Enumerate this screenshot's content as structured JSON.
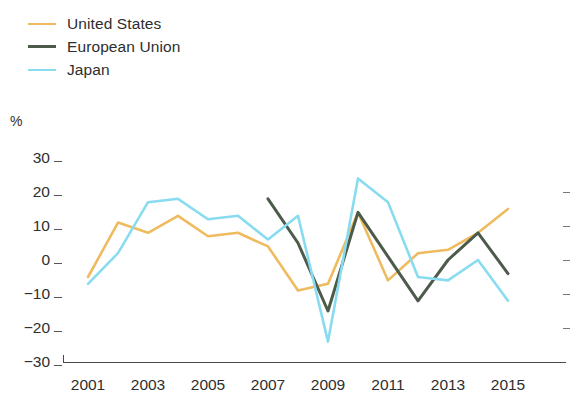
{
  "legend": {
    "position": "top-left",
    "items": [
      {
        "label": "United States",
        "color": "#efbb5f",
        "key": "united_states"
      },
      {
        "label": "European Union",
        "color": "#4c5b4a",
        "key": "european_union"
      },
      {
        "label": "Japan",
        "color": "#89dcf0",
        "key": "japan"
      }
    ]
  },
  "axis": {
    "unit_label": "%",
    "y_ticks": [
      "30",
      "20",
      "10",
      "0",
      "−10",
      "−20",
      "−30"
    ],
    "x_ticks": [
      "2001",
      "2003",
      "2005",
      "2007",
      "2009",
      "2011",
      "2013",
      "2015"
    ]
  },
  "chart_data": {
    "type": "line",
    "title": "",
    "subtitle": "",
    "xlabel": "",
    "ylabel": "%",
    "ylim": [
      -30,
      30
    ],
    "xlim": [
      2001,
      2015
    ],
    "grid": false,
    "legend_position": "top-left",
    "x": [
      2001,
      2002,
      2003,
      2004,
      2005,
      2006,
      2007,
      2008,
      2009,
      2010,
      2011,
      2012,
      2013,
      2014,
      2015
    ],
    "series": [
      {
        "name": "United States",
        "color": "#efbb5f",
        "values": [
          -5,
          11,
          8,
          13,
          7,
          8,
          4,
          -9,
          -7,
          14,
          -6,
          2,
          3,
          8,
          15
        ]
      },
      {
        "name": "European Union",
        "color": "#4c5b4a",
        "values": [
          null,
          null,
          null,
          null,
          null,
          null,
          18,
          5,
          -15,
          14,
          1,
          -12,
          0,
          8,
          -4
        ]
      },
      {
        "name": "Japan",
        "color": "#89dcf0",
        "values": [
          -7,
          2,
          17,
          18,
          12,
          13,
          6,
          13,
          -24,
          24,
          17,
          -5,
          -6,
          0,
          -12
        ]
      }
    ]
  }
}
